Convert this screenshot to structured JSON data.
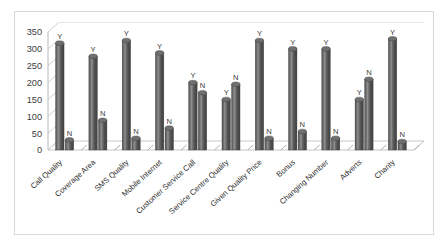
{
  "chart_data": {
    "type": "bar",
    "title": "",
    "subtitle": "",
    "xlabel": "",
    "ylabel": "",
    "ylim": [
      0,
      350
    ],
    "ytick_step": 50,
    "ytick_labels": [
      "0",
      "50",
      "100",
      "150",
      "200",
      "250",
      "300",
      "350"
    ],
    "grid": true,
    "legend": "none",
    "style": "3d-cylinder",
    "bar_value_labels": [
      "Y",
      "N"
    ],
    "categories": [
      "Call Quality",
      "Coverage Area",
      "SMS Quality",
      "Mobile Internet",
      "Customer Service Call",
      "Service Centre Quality",
      "Given Quality Price",
      "Bonus",
      "Changing Number",
      "Adverts",
      "Charity"
    ],
    "series": [
      {
        "name": "Y",
        "values": [
          317,
          278,
          325,
          288,
          200,
          150,
          325,
          300,
          300,
          150,
          330
        ]
      },
      {
        "name": "N",
        "values": [
          30,
          88,
          35,
          65,
          170,
          195,
          35,
          55,
          35,
          210,
          25
        ]
      }
    ],
    "colors": {
      "bar_dark": "#4a4a4a",
      "bar_light": "#8c8c8c",
      "bar_top": "#6f6f6f",
      "gridline": "#b9b9b9",
      "axis": "#a6a6a6",
      "frame": "#d9d9d9",
      "text": "#2f2f2f"
    }
  }
}
